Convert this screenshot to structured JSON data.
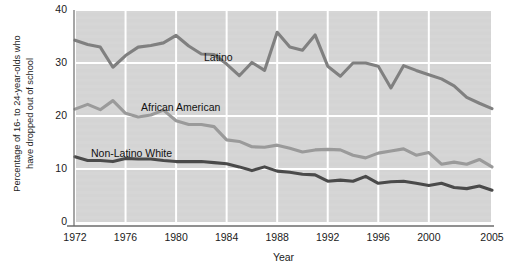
{
  "chart_data": {
    "type": "line",
    "title": "",
    "xlabel": "Year",
    "ylabel_line1": "Percentage of 16- to 24-year-olds who",
    "ylabel_line2": "have dropped out of school",
    "xlim": [
      1972,
      2005
    ],
    "ylim": [
      0,
      40
    ],
    "grid": true,
    "legend": "inline-labels",
    "ytick_labels": [
      "0",
      "10",
      "20",
      "30",
      "40"
    ],
    "ytick_values": [
      0,
      10,
      20,
      30,
      40
    ],
    "xtick_labels": [
      "1972",
      "1976",
      "1980",
      "1984",
      "1988",
      "1992",
      "1996",
      "2000",
      "2005"
    ],
    "xtick_values": [
      1972,
      1976,
      1980,
      1984,
      1988,
      1992,
      1996,
      2000,
      2005
    ],
    "x": [
      1972,
      1973,
      1974,
      1975,
      1976,
      1977,
      1978,
      1979,
      1980,
      1981,
      1982,
      1983,
      1984,
      1985,
      1986,
      1987,
      1988,
      1989,
      1990,
      1991,
      1992,
      1993,
      1994,
      1995,
      1996,
      1997,
      1998,
      1999,
      2000,
      2001,
      2002,
      2003,
      2004,
      2005
    ],
    "series": [
      {
        "name": "Latino",
        "color": "#808080",
        "label_text": "Latino",
        "values": [
          34.3,
          33.5,
          33.0,
          29.2,
          31.4,
          33.0,
          33.3,
          33.8,
          35.2,
          33.2,
          31.7,
          31.6,
          29.8,
          27.6,
          30.1,
          28.6,
          35.8,
          33.0,
          32.4,
          35.3,
          29.4,
          27.5,
          30.0,
          30.0,
          29.4,
          25.3,
          29.5,
          28.6,
          27.8,
          27.0,
          25.7,
          23.5,
          22.4,
          21.4
        ]
      },
      {
        "name": "African American",
        "color": "#9a9a9a",
        "label_text": "African American",
        "values": [
          21.3,
          22.2,
          21.2,
          22.9,
          20.5,
          19.8,
          20.2,
          21.1,
          19.1,
          18.4,
          18.4,
          18.0,
          15.5,
          15.2,
          14.2,
          14.1,
          14.5,
          13.9,
          13.2,
          13.6,
          13.7,
          13.6,
          12.6,
          12.1,
          13.0,
          13.4,
          13.8,
          12.6,
          13.1,
          10.9,
          11.3,
          10.9,
          11.8,
          10.4
        ]
      },
      {
        "name": "Non-Latino White",
        "color": "#4a4a4a",
        "label_text": "Non-Latino White",
        "values": [
          12.3,
          11.6,
          11.6,
          11.4,
          12.0,
          11.9,
          11.9,
          11.6,
          11.4,
          11.4,
          11.4,
          11.2,
          11.0,
          10.4,
          9.7,
          10.4,
          9.6,
          9.4,
          9.0,
          8.9,
          7.7,
          7.9,
          7.7,
          8.6,
          7.3,
          7.6,
          7.7,
          7.3,
          6.9,
          7.3,
          6.5,
          6.3,
          6.8,
          6.0
        ]
      }
    ],
    "series_label_positions": [
      {
        "name": "Latino",
        "left": 204,
        "top": 51
      },
      {
        "name": "African American",
        "left": 141,
        "top": 101
      },
      {
        "name": "Non-Latino White",
        "left": 91,
        "top": 147
      }
    ],
    "plot_area": {
      "left": 75,
      "top": 10,
      "right": 492,
      "bottom": 222
    },
    "plot_bg": "#d4d4d4",
    "grid_color": "#ffffff",
    "axis_color": "#6b6b6b"
  }
}
